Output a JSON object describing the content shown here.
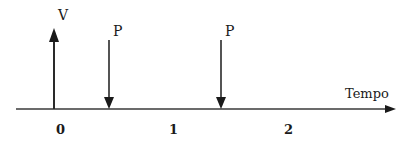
{
  "diagram": {
    "axis": {
      "label": "Tempo"
    },
    "ticks": [
      {
        "label": "0",
        "x": 60
      },
      {
        "label": "1",
        "x": 173
      },
      {
        "label": "2",
        "x": 288
      }
    ],
    "arrows": [
      {
        "label": "V",
        "direction": "up",
        "x": 54
      },
      {
        "label": "P",
        "direction": "down",
        "x": 109
      },
      {
        "label": "P",
        "direction": "down",
        "x": 221
      }
    ],
    "colors": {
      "stroke": "#2a2a2a",
      "text": "#1a1a1a"
    }
  }
}
